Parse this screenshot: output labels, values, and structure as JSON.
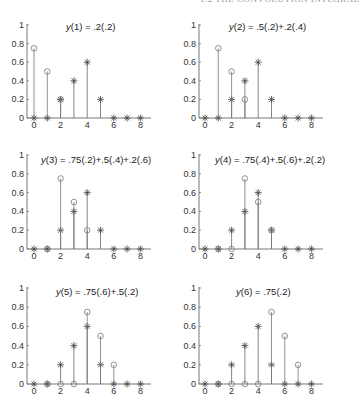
{
  "header": "1.2 THE CONVOLUTION INTEGRAL",
  "chart_data": [
    {
      "type": "stem",
      "title": "y(1) = .2(.2)",
      "x": [
        0,
        1,
        2,
        3,
        4,
        5,
        6,
        7,
        8
      ],
      "series": [
        {
          "name": "star",
          "marker": "*",
          "x": [
            0,
            1,
            2,
            3,
            4,
            5,
            6,
            7,
            8
          ],
          "values": [
            0,
            0,
            0.2,
            0.4,
            0.6,
            0.2,
            0,
            0,
            0
          ]
        },
        {
          "name": "circle",
          "marker": "o",
          "x": [
            0,
            1,
            2
          ],
          "values": [
            0.75,
            0.5,
            0.2
          ]
        }
      ],
      "xticks": [
        0,
        2,
        4,
        6,
        8
      ],
      "yticks": [
        0,
        0.2,
        0.4,
        0.6,
        0.8,
        1
      ],
      "ylim": [
        0,
        1
      ],
      "xlim": [
        -0.5,
        9
      ]
    },
    {
      "type": "stem",
      "title": "y(2) = .5(.2)+.2(.4)",
      "x": [
        0,
        1,
        2,
        3,
        4,
        5,
        6,
        7,
        8
      ],
      "series": [
        {
          "name": "star",
          "marker": "*",
          "x": [
            0,
            1,
            2,
            3,
            4,
            5,
            6,
            7,
            8
          ],
          "values": [
            0,
            0,
            0.2,
            0.4,
            0.6,
            0.2,
            0,
            0,
            0
          ]
        },
        {
          "name": "circle",
          "marker": "o",
          "x": [
            1,
            2,
            3
          ],
          "values": [
            0.75,
            0.5,
            0.2
          ]
        }
      ],
      "xticks": [
        0,
        2,
        4,
        6,
        8
      ],
      "yticks": [
        0,
        0.2,
        0.4,
        0.6,
        0.8,
        1
      ],
      "ylim": [
        0,
        1
      ],
      "xlim": [
        -0.5,
        9
      ]
    },
    {
      "type": "stem",
      "title": "y(3) = .75(.2)+.5(.4)+.2(.6)",
      "x": [
        0,
        1,
        2,
        3,
        4,
        5,
        6,
        7,
        8
      ],
      "series": [
        {
          "name": "star",
          "marker": "*",
          "x": [
            0,
            1,
            2,
            3,
            4,
            5,
            6,
            7,
            8
          ],
          "values": [
            0,
            0,
            0.2,
            0.4,
            0.6,
            0.2,
            0,
            0,
            0
          ]
        },
        {
          "name": "circle",
          "marker": "o",
          "x": [
            1,
            2,
            3,
            4
          ],
          "values": [
            0,
            0.75,
            0.5,
            0.2
          ]
        }
      ],
      "xticks": [
        0,
        2,
        4,
        6,
        8
      ],
      "yticks": [
        0,
        0.2,
        0.4,
        0.6,
        0.8,
        1
      ],
      "ylim": [
        0,
        1
      ],
      "xlim": [
        -0.5,
        9
      ]
    },
    {
      "type": "stem",
      "title": "y(4) = .75(.4)+.5(.6)+.2(.2)",
      "x": [
        0,
        1,
        2,
        3,
        4,
        5,
        6,
        7,
        8
      ],
      "series": [
        {
          "name": "star",
          "marker": "*",
          "x": [
            0,
            1,
            2,
            3,
            4,
            5,
            6,
            7,
            8
          ],
          "values": [
            0,
            0,
            0.2,
            0.4,
            0.6,
            0.2,
            0,
            0,
            0
          ]
        },
        {
          "name": "circle",
          "marker": "o",
          "x": [
            1,
            2,
            3,
            4,
            5
          ],
          "values": [
            0,
            0,
            0.75,
            0.5,
            0.2
          ]
        }
      ],
      "xticks": [
        0,
        2,
        4,
        6,
        8
      ],
      "yticks": [
        0,
        0.2,
        0.4,
        0.6,
        0.8,
        1
      ],
      "ylim": [
        0,
        1
      ],
      "xlim": [
        -0.5,
        9
      ]
    },
    {
      "type": "stem",
      "title": "y(5) = .75(.6)+.5(.2)",
      "x": [
        0,
        1,
        2,
        3,
        4,
        5,
        6,
        7,
        8
      ],
      "series": [
        {
          "name": "star",
          "marker": "*",
          "x": [
            0,
            1,
            2,
            3,
            4,
            5,
            6,
            7,
            8
          ],
          "values": [
            0,
            0,
            0.2,
            0.4,
            0.6,
            0.2,
            0,
            0,
            0
          ]
        },
        {
          "name": "circle",
          "marker": "o",
          "x": [
            1,
            2,
            3,
            4,
            5,
            6
          ],
          "values": [
            0,
            0,
            0,
            0.75,
            0.5,
            0.2
          ]
        }
      ],
      "xticks": [
        0,
        2,
        4,
        6,
        8
      ],
      "yticks": [
        0,
        0.2,
        0.4,
        0.6,
        0.8,
        1
      ],
      "ylim": [
        0,
        1
      ],
      "xlim": [
        -0.5,
        9
      ]
    },
    {
      "type": "stem",
      "title": "y(6) = .75(.2)",
      "x": [
        0,
        1,
        2,
        3,
        4,
        5,
        6,
        7,
        8
      ],
      "series": [
        {
          "name": "star",
          "marker": "*",
          "x": [
            0,
            1,
            2,
            3,
            4,
            5,
            6,
            7,
            8
          ],
          "values": [
            0,
            0,
            0.2,
            0.4,
            0.6,
            0.2,
            0,
            0,
            0
          ]
        },
        {
          "name": "circle",
          "marker": "o",
          "x": [
            1,
            2,
            3,
            4,
            5,
            6,
            7
          ],
          "values": [
            0,
            0,
            0,
            0,
            0.75,
            0.5,
            0.2
          ]
        }
      ],
      "xticks": [
        0,
        2,
        4,
        6,
        8
      ],
      "yticks": [
        0,
        0.2,
        0.4,
        0.6,
        0.8,
        1
      ],
      "ylim": [
        0,
        1
      ],
      "xlim": [
        -0.5,
        9
      ]
    }
  ],
  "layout": {
    "panels": [
      {
        "axisX": 27,
        "x0": 34,
        "y0": 118,
        "y1": 25,
        "titleX": 66,
        "titleY": 30
      },
      {
        "axisX": 199,
        "x0": 205,
        "y0": 118,
        "y1": 25,
        "titleX": 229,
        "titleY": 30
      },
      {
        "axisX": 27,
        "x0": 34,
        "y0": 249,
        "y1": 155,
        "titleX": 41,
        "titleY": 163
      },
      {
        "axisX": 199,
        "x0": 205,
        "y0": 249,
        "y1": 155,
        "titleX": 215,
        "titleY": 163
      },
      {
        "axisX": 27,
        "x0": 34,
        "y0": 384,
        "y1": 288,
        "titleX": 56,
        "titleY": 295
      },
      {
        "axisX": 199,
        "x0": 205,
        "y0": 384,
        "y1": 288,
        "titleX": 236,
        "titleY": 295
      }
    ],
    "unitX": 13.3,
    "axisEndOffset": 124
  }
}
